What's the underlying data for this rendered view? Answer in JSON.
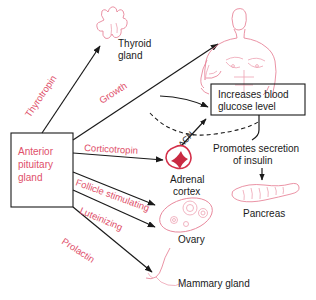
{
  "diagram": {
    "source_box": {
      "label": "Anterior pituitary gland",
      "line1": "Anterior",
      "line2": "pituitary",
      "line3": "gland",
      "text_color": "#e0506a"
    },
    "hormones": [
      {
        "name": "Thyrotropin",
        "target": "Thyroid gland"
      },
      {
        "name": "Growth",
        "target": "Body / Increases blood glucose level"
      },
      {
        "name": "Corticotropin",
        "target": "Adrenal cortex"
      },
      {
        "name": "Follicle stimulating",
        "target": "Ovary"
      },
      {
        "name": "Luteinizing",
        "target": "Ovary"
      },
      {
        "name": "Prolactin",
        "target": "Mammary gland"
      }
    ],
    "targets": [
      {
        "id": "thyroid",
        "line1": "Thyroid",
        "line2": "gland",
        "icon": "thyroid-gland-icon"
      },
      {
        "id": "body",
        "label": "",
        "icon": "human-torso-icon"
      },
      {
        "id": "adrenal",
        "line1": "Adrenal",
        "line2": "cortex",
        "icon": "adrenal-cortex-icon"
      },
      {
        "id": "ovary",
        "line1": "Ovary",
        "line2": "",
        "icon": "ovary-icon"
      },
      {
        "id": "pancreas",
        "line1": "Pancreas",
        "line2": "",
        "icon": "pancreas-icon"
      },
      {
        "id": "mammary",
        "line1": "Mammary gland",
        "line2": "",
        "icon": "mammary-gland-icon"
      }
    ],
    "effect_box": {
      "line1": "Increases blood",
      "line2": "glucose level"
    },
    "insulin_text": {
      "line1": "Promotes secretion",
      "line2": "of insulin"
    },
    "ach_label": "ACH",
    "colors": {
      "hormone_text": "#e0506a",
      "organ_outline": "#e8879b",
      "adrenal": "#c92a42",
      "connector": "#1a1a1a"
    }
  }
}
